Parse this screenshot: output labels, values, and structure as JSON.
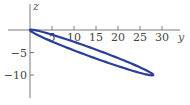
{
  "chart_data": {
    "type": "line",
    "title": "",
    "xlabel": "y",
    "ylabel": "z",
    "xlim": [
      0,
      33
    ],
    "ylim": [
      -15,
      6
    ],
    "x_ticks": [
      5,
      10,
      15,
      20,
      25,
      30
    ],
    "y_ticks": [
      -5,
      -10
    ],
    "x_tick_labels": [
      "5",
      "10",
      "15",
      "20",
      "25",
      "30"
    ],
    "y_tick_labels": [
      "−5",
      "−10"
    ],
    "grid": false,
    "legend": null,
    "series": [
      {
        "name": "ellipse",
        "description": "Thin ellipse through origin, tip near (28, -10)",
        "color": "#2b3f9a",
        "center": [
          14,
          -5
        ],
        "endpoints": [
          [
            0,
            0
          ],
          [
            28,
            -10
          ]
        ],
        "x": [
          0,
          5,
          10,
          15,
          20,
          25,
          28,
          25,
          20,
          15,
          10,
          5,
          0
        ],
        "y": [
          0,
          -0.9,
          -2.4,
          -4.1,
          -5.9,
          -7.8,
          -10,
          -9.2,
          -7.6,
          -5.9,
          -4.1,
          -2.3,
          0
        ]
      }
    ]
  },
  "colors": {
    "axis": "#7a7a7a",
    "curve": "#2b3f9a",
    "text": "#444444"
  }
}
